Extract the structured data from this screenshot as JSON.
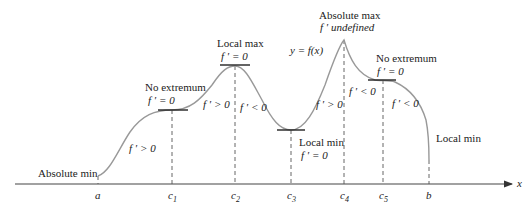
{
  "diagram": {
    "curve_label": "y = f(x)",
    "axis": {
      "x_label": "x"
    },
    "ticks": [
      {
        "id": "a",
        "label": "a",
        "x": 98
      },
      {
        "id": "c1",
        "label": "c",
        "sub": "1",
        "x": 172
      },
      {
        "id": "c2",
        "label": "c",
        "sub": "2",
        "x": 235
      },
      {
        "id": "c3",
        "label": "c",
        "sub": "3",
        "x": 291
      },
      {
        "id": "c4",
        "label": "c",
        "sub": "4",
        "x": 344
      },
      {
        "id": "c5",
        "label": "c",
        "sub": "5",
        "x": 383
      },
      {
        "id": "b",
        "label": "b",
        "x": 429
      }
    ],
    "annotations": {
      "absolute_min": "Absolute min",
      "no_extremum_1": "No extremum",
      "no_extremum_1_eq": "f ′ = 0",
      "local_max": "Local max",
      "local_max_eq": "f ′ = 0",
      "absolute_max": "Absolute max",
      "absolute_max_eq": "f ′  undefined",
      "no_extremum_2": "No extremum",
      "no_extremum_2_eq": "f ′ = 0",
      "local_min_c3": "Local min",
      "local_min_c3_eq": "f ′ = 0",
      "local_min_b": "Local min",
      "deriv_a_c1": "f ′ > 0",
      "deriv_c1_c2": "f ′ > 0",
      "deriv_c2_c3": "f ′ < 0",
      "deriv_c3_c4": "f ′ > 0",
      "deriv_c4_c5": "f ′ < 0",
      "deriv_c5_b": "f ′ < 0"
    }
  }
}
